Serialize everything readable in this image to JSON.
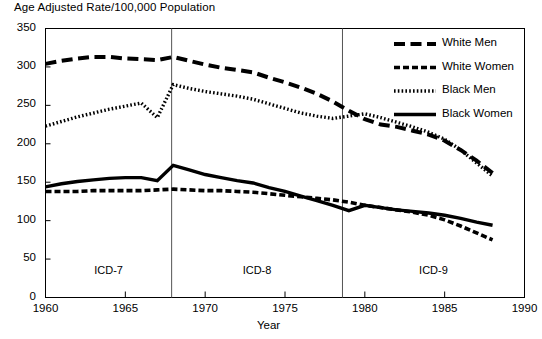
{
  "chart_data": {
    "type": "line",
    "title": "Age Adjusted Rate/100,000 Population",
    "xlabel": "Year",
    "ylabel": "",
    "xlim": [
      1960,
      1990
    ],
    "ylim": [
      0,
      350
    ],
    "ytick_labels": [
      "0",
      "50",
      "100",
      "150",
      "200",
      "250",
      "300",
      "350"
    ],
    "yticks": [
      0,
      50,
      100,
      150,
      200,
      250,
      300,
      350
    ],
    "xtick_labels": [
      "1960",
      "1965",
      "1970",
      "1975",
      "1980",
      "1985",
      "1990"
    ],
    "xticks": [
      1960,
      1965,
      1970,
      1975,
      1980,
      1985,
      1990
    ],
    "grid": false,
    "legend_position": "top-right",
    "x": [
      1960,
      1961,
      1962,
      1963,
      1964,
      1965,
      1966,
      1967,
      1968,
      1969,
      1970,
      1971,
      1972,
      1973,
      1974,
      1975,
      1976,
      1977,
      1978,
      1979,
      1980,
      1981,
      1982,
      1983,
      1984,
      1985,
      1986,
      1987,
      1988
    ],
    "series": [
      {
        "name": "White Men",
        "style": "long-dash",
        "values": [
          304,
          308,
          311,
          313,
          313,
          311,
          310,
          309,
          313,
          308,
          303,
          299,
          296,
          293,
          286,
          280,
          273,
          265,
          255,
          243,
          232,
          225,
          222,
          217,
          212,
          204,
          192,
          178,
          162
        ]
      },
      {
        "name": "White Women",
        "style": "short-dash",
        "values": [
          138,
          138,
          138,
          139,
          139,
          139,
          139,
          140,
          141,
          140,
          139,
          139,
          138,
          137,
          135,
          133,
          131,
          129,
          127,
          124,
          120,
          117,
          114,
          111,
          107,
          101,
          93,
          84,
          75
        ]
      },
      {
        "name": "Black Men",
        "style": "dotted",
        "values": [
          223,
          229,
          235,
          240,
          245,
          249,
          253,
          234,
          277,
          272,
          268,
          265,
          262,
          258,
          252,
          246,
          240,
          236,
          233,
          236,
          239,
          234,
          228,
          222,
          215,
          206,
          192,
          175,
          158
        ]
      },
      {
        "name": "Black Women",
        "style": "solid",
        "values": [
          144,
          148,
          151,
          153,
          155,
          156,
          156,
          152,
          172,
          166,
          160,
          156,
          152,
          149,
          143,
          138,
          132,
          126,
          120,
          113,
          120,
          117,
          114,
          112,
          110,
          107,
          103,
          98,
          94
        ]
      }
    ],
    "eras": [
      {
        "label": "ICD-7",
        "start": 1960,
        "end": 1967.9
      },
      {
        "label": "ICD-8",
        "start": 1967.9,
        "end": 1978.6
      },
      {
        "label": "ICD-9",
        "start": 1978.6,
        "end": 1990
      }
    ],
    "era_divider_years": [
      1967.9,
      1978.6
    ]
  },
  "colors": {
    "line": "#000000",
    "axis": "#000000",
    "background": "#ffffff",
    "divider": "#555555"
  }
}
